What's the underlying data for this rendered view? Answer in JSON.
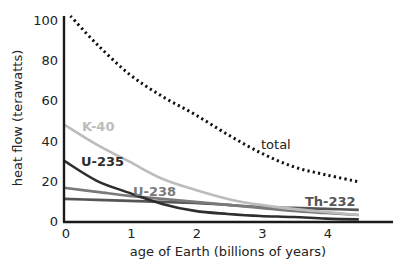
{
  "chart_data": {
    "type": "line",
    "title": "",
    "xlabel": "age of Earth (billions of years)",
    "ylabel": "heat flow (terawatts)",
    "xlim": [
      0,
      5
    ],
    "ylim": [
      0,
      100
    ],
    "x_ticks": [
      0,
      1,
      2,
      3,
      4
    ],
    "y_ticks": [
      0,
      20,
      40,
      60,
      80,
      100
    ],
    "grid": false,
    "legend": "inline labels",
    "x": [
      0,
      0.5,
      1,
      1.5,
      2,
      2.5,
      3,
      3.5,
      4,
      4.5
    ],
    "series": [
      {
        "name": "total",
        "style": "dotted",
        "color": "#111111",
        "values": [
          105,
          88,
          73,
          62,
          53,
          43,
          34,
          27,
          23,
          19.5
        ]
      },
      {
        "name": "K-40",
        "style": "solid",
        "color": "#bcbcbc",
        "values": [
          48,
          38,
          29.5,
          21,
          15.5,
          11,
          8,
          6,
          4.5,
          3
        ]
      },
      {
        "name": "U-235",
        "style": "solid",
        "color": "#2e2e2e",
        "values": [
          30,
          20,
          14,
          8.5,
          5,
          3.5,
          2.5,
          2,
          1.2,
          0.8
        ]
      },
      {
        "name": "U-238",
        "style": "solid",
        "color": "#7a7a7a",
        "values": [
          16.5,
          14.5,
          12.5,
          11,
          9.5,
          8,
          6.5,
          5,
          4,
          3
        ]
      },
      {
        "name": "Th-232",
        "style": "solid",
        "color": "#555555",
        "values": [
          11,
          10.5,
          10,
          9.5,
          9,
          8,
          7,
          6.5,
          6,
          5.5
        ]
      }
    ],
    "annotations": [
      {
        "text": "K-40",
        "x": 0.3,
        "y": 53
      },
      {
        "text": "U-235",
        "x": 0.3,
        "y": 35
      },
      {
        "text": "U-238",
        "x": 1.05,
        "y": 18
      },
      {
        "text": "Th-232",
        "x": 3.85,
        "y": 10
      },
      {
        "text": "total",
        "x": 3.0,
        "y": 36
      }
    ]
  },
  "labels": {
    "xlabel": "age of Earth (billions of years)",
    "ylabel": "heat flow (terawatts)",
    "total": "total",
    "k40": "K-40",
    "u235": "U-235",
    "u238": "U-238",
    "th232": "Th-232"
  }
}
